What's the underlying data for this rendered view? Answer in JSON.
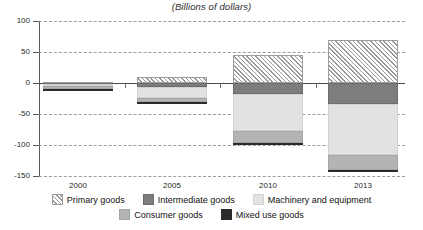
{
  "chart_data": {
    "type": "bar",
    "title": "(Billions of dollars)",
    "subtitle": "",
    "xlabel": "",
    "ylabel": "",
    "stacked": true,
    "grid": true,
    "legend_position": "bottom",
    "ylim": [
      -150,
      100
    ],
    "yticks": [
      100,
      50,
      0,
      -50,
      -100,
      -150
    ],
    "ytick_labels": [
      "100",
      "50",
      "0",
      "-50",
      "-100",
      "-150"
    ],
    "categories": [
      "2000",
      "2005",
      "2010",
      "2013"
    ],
    "series": [
      {
        "name": "Primary goods",
        "values": [
          1,
          10,
          45,
          70
        ]
      },
      {
        "name": "Intermediate goods",
        "values": [
          -2,
          -6,
          -17,
          -34
        ]
      },
      {
        "name": "Machinery and equipment",
        "values": [
          -3,
          -18,
          -60,
          -82
        ]
      },
      {
        "name": "Consumer goods",
        "values": [
          -4,
          -7,
          -20,
          -25
        ]
      },
      {
        "name": "Mixed use goods",
        "values": [
          -1,
          -1,
          -3,
          -2
        ]
      }
    ],
    "legend": [
      {
        "label": "Primary goods",
        "swatch": "hatched"
      },
      {
        "label": "Intermediate goods",
        "swatch": "dark-gray"
      },
      {
        "label": "Machinery and equipment",
        "swatch": "light-gray"
      },
      {
        "label": "Consumer goods",
        "swatch": "medium-gray"
      },
      {
        "label": "Mixed use goods",
        "swatch": "black"
      }
    ],
    "colors": {
      "primary_goods": "#fbfbfb",
      "intermediate_goods": "#7d7d7d",
      "machinery_and_equipment": "#e2e2e2",
      "consumer_goods": "#b4b4b4",
      "mixed_use_goods": "#2b2b2b",
      "grid": "#8d8d8d",
      "axis": "#4a4a4a"
    }
  }
}
